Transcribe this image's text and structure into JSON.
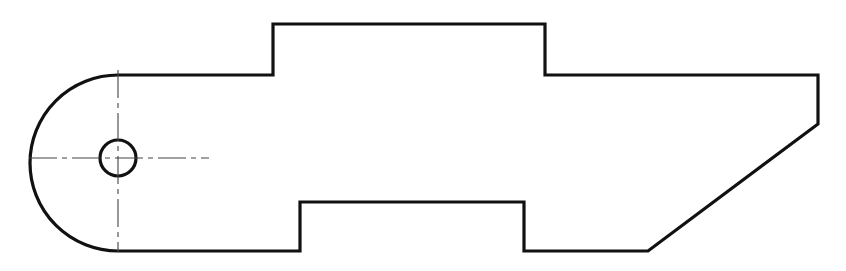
{
  "drawing": {
    "title": "Mechanical part outline - orthographic view",
    "canvas": {
      "width": 846,
      "height": 271,
      "background_color": "#ffffff"
    },
    "style": {
      "outline_color": "#111111",
      "outline_width": 3.2,
      "centerline_color": "#444444",
      "centerline_width": 1.1
    },
    "geometry": {
      "hole": {
        "label": "through-hole",
        "center_x": 118,
        "center_y": 158,
        "radius": 18,
        "diameter": 36
      },
      "left_arc": {
        "label": "rounded-end-radius",
        "center_x": 118,
        "center_y": 163,
        "radius": 88,
        "leftmost_x": 30
      },
      "centerlines": {
        "horizontal": {
          "x1": 29,
          "y1": 158,
          "x2": 209,
          "y2": 158
        },
        "vertical": {
          "x1": 118,
          "y1": 70,
          "x2": 118,
          "y2": 252
        },
        "dash_pattern": "28 5 5 5"
      },
      "outline_points": [
        {
          "name": "arc-top-tangent",
          "x": 118,
          "y": 75
        },
        {
          "name": "top-boss-left-base",
          "x": 273,
          "y": 75
        },
        {
          "name": "top-boss-left-top",
          "x": 273,
          "y": 24
        },
        {
          "name": "top-boss-right-top",
          "x": 545,
          "y": 24
        },
        {
          "name": "top-boss-right-base",
          "x": 545,
          "y": 75
        },
        {
          "name": "top-right-corner",
          "x": 818,
          "y": 75
        },
        {
          "name": "chamfer-start",
          "x": 818,
          "y": 124
        },
        {
          "name": "chamfer-end",
          "x": 648,
          "y": 251
        },
        {
          "name": "bottom-notch-right-base",
          "x": 524,
          "y": 251
        },
        {
          "name": "bottom-notch-right-top",
          "x": 524,
          "y": 202
        },
        {
          "name": "bottom-notch-left-top",
          "x": 300,
          "y": 202
        },
        {
          "name": "bottom-notch-left-base",
          "x": 300,
          "y": 251
        },
        {
          "name": "arc-bottom-tangent",
          "x": 118,
          "y": 251
        }
      ],
      "outline_path": "M 118 75 L 273 75 L 273 24 L 545 24 L 545 75 L 818 75 L 818 124 L 648 251 L 524 251 L 524 202 L 300 202 L 300 251 L 118 251 A 88 88 0 0 1 118 75 Z"
    }
  }
}
